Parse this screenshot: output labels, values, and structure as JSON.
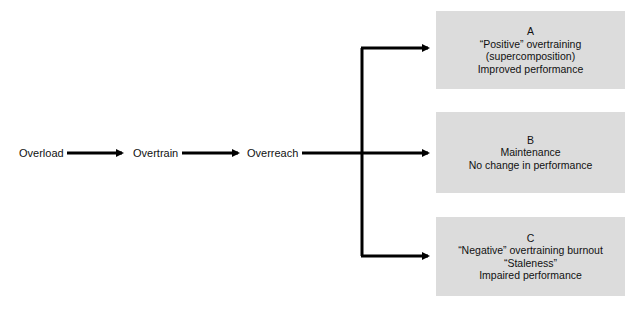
{
  "diagram": {
    "stages": [
      "Overload",
      "Overtrain",
      "Overreach"
    ],
    "outcomes": [
      {
        "letter": "A",
        "lines": [
          "“Positive” overtraining",
          "(supercomposition)",
          "Improved performance"
        ]
      },
      {
        "letter": "B",
        "lines": [
          "Maintenance",
          "No change in performance"
        ]
      },
      {
        "letter": "C",
        "lines": [
          "“Negative” overtraining burnout",
          "“Staleness”",
          "Impaired performance"
        ]
      }
    ],
    "colors": {
      "box_fill": "#dcdcdc",
      "arrow": "#000000",
      "text": "#111111"
    }
  }
}
